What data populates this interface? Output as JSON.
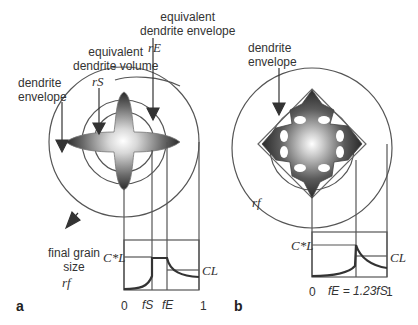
{
  "panel_a": {
    "label": "a",
    "annotations": {
      "equivalent_envelope_line1": "equivalent",
      "equivalent_envelope_line2": "dendrite envelope",
      "equivalent_envelope_symbol": "rE",
      "equivalent_volume_line1": "equivalent",
      "equivalent_volume_line2": "dendrite volume",
      "equivalent_volume_symbol": "rS",
      "dendrite_envelope_line1": "dendrite",
      "dendrite_envelope_line2": "envelope",
      "final_grain_line1": "final grain",
      "final_grain_line2": "size",
      "final_grain_symbol": "rf"
    },
    "plot": {
      "y_label_top": "C*L",
      "y_label_right": "CL",
      "x_ticks": [
        "0",
        "fS",
        "fE",
        "1"
      ]
    }
  },
  "panel_b": {
    "label": "b",
    "annotations": {
      "dendrite_envelope_line1": "dendrite",
      "dendrite_envelope_line2": "envelope",
      "final_grain_symbol": "rf"
    },
    "plot": {
      "y_label_top": "C*L",
      "y_label_right": "CL",
      "x_ticks": [
        "0",
        "fE = 1.23fS",
        "1"
      ]
    }
  },
  "colors": {
    "line": "#555555",
    "curve": "#333333",
    "dendrite_dark": "#2a2a2a",
    "dendrite_light": "#ffffff"
  }
}
